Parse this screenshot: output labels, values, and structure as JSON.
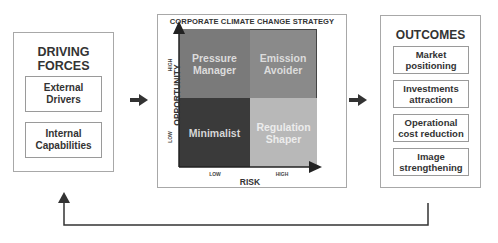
{
  "driving_forces": {
    "title_line1": "DRIVING",
    "title_line2": "FORCES",
    "items": [
      {
        "line1": "External",
        "line2": "Drivers"
      },
      {
        "line1": "Internal",
        "line2": "Capabilities"
      }
    ]
  },
  "strategy": {
    "title": "CORPORATE CLIMATE CHANGE STRATEGY",
    "y_axis_label": "OPPORTUNITY",
    "x_axis_label": "RISK",
    "y_ticks": [
      "HIGH",
      "LOW"
    ],
    "x_ticks": [
      "LOW",
      "HIGH"
    ],
    "quadrants": [
      {
        "position": "top-left",
        "line1": "Pressure",
        "line2": "Manager",
        "color": "#7a7a7a"
      },
      {
        "position": "top-right",
        "line1": "Emission",
        "line2": "Avoider",
        "color": "#8c8c8c"
      },
      {
        "position": "bottom-left",
        "line1": "Minimalist",
        "line2": "",
        "color": "#3a3a3a"
      },
      {
        "position": "bottom-right",
        "line1": "Regulation",
        "line2": "Shaper",
        "color": "#b9b9b9"
      }
    ]
  },
  "outcomes": {
    "title": "OUTCOMES",
    "items": [
      {
        "line1": "Market",
        "line2": "positioning"
      },
      {
        "line1": "Investments",
        "line2": "attraction"
      },
      {
        "line1": "Operational",
        "line2": "cost reduction"
      },
      {
        "line1": "Image",
        "line2": "strengthening"
      }
    ]
  }
}
